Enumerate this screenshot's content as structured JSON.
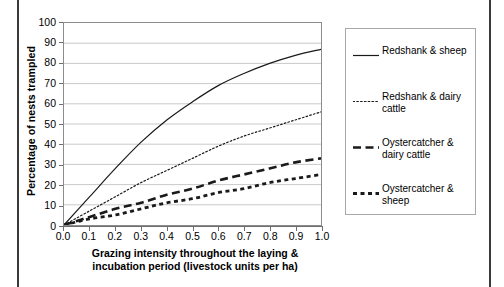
{
  "figure": {
    "y_axis_title": "Percentage of nests trampled",
    "x_axis_title_line1": "Grazing intensity throughout the laying &",
    "x_axis_title_line2": "incubation period (livestock units per ha)"
  },
  "legend": {
    "items": [
      {
        "label": "Redshank & sheep",
        "style": "solid",
        "color": "#1a1a1a"
      },
      {
        "label": "Redshank & dairy cattle",
        "style": "dotted",
        "color": "#1a1a1a"
      },
      {
        "label": "Oystercatcher & dairy cattle",
        "style": "long-dash",
        "color": "#1a1a1a"
      },
      {
        "label": "Oystercatcher & sheep",
        "style": "short-dash",
        "color": "#1a1a1a"
      }
    ]
  },
  "chart_data": {
    "type": "line",
    "title": "",
    "xlabel": "Grazing intensity throughout the laying & incubation period (livestock units per ha)",
    "ylabel": "Percentage of nests trampled",
    "xlim": [
      0.0,
      1.0
    ],
    "ylim": [
      0,
      100
    ],
    "grid": "horizontal",
    "legend_position": "right",
    "x_ticks": [
      "0.0",
      "0.1",
      "0.2",
      "0.3",
      "0.4",
      "0.5",
      "0.6",
      "0.7",
      "0.8",
      "0.9",
      "1.0"
    ],
    "y_ticks": [
      "0",
      "10",
      "20",
      "30",
      "40",
      "50",
      "60",
      "70",
      "80",
      "90",
      "100"
    ],
    "x": [
      0.0,
      0.1,
      0.2,
      0.3,
      0.4,
      0.5,
      0.6,
      0.7,
      0.8,
      0.9,
      1.0
    ],
    "series": [
      {
        "name": "Redshank & sheep",
        "line_style": "solid",
        "values": [
          0,
          14,
          28,
          41,
          52,
          61,
          69,
          75,
          80,
          84,
          87
        ]
      },
      {
        "name": "Redshank & dairy cattle",
        "line_style": "dotted",
        "values": [
          0,
          7,
          14,
          21,
          27,
          33,
          39,
          44,
          48,
          52,
          56
        ]
      },
      {
        "name": "Oystercatcher & dairy cattle",
        "line_style": "long-dash",
        "values": [
          0,
          4,
          8,
          11,
          15,
          18,
          22,
          25,
          28,
          31,
          33
        ]
      },
      {
        "name": "Oystercatcher & sheep",
        "line_style": "short-dash",
        "values": [
          0,
          3,
          5,
          8,
          11,
          13,
          16,
          18,
          21,
          23,
          25
        ]
      }
    ]
  }
}
